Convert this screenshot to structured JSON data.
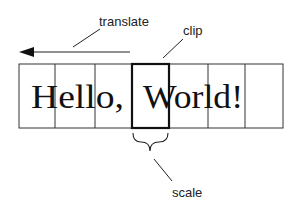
{
  "diagram": {
    "labels": {
      "translate": "translate",
      "clip": "clip",
      "scale": "scale"
    },
    "text": {
      "hello": "Hello,",
      "world": "World!"
    },
    "cells": [
      {
        "x": 19,
        "w": 36
      },
      {
        "x": 55,
        "w": 40
      },
      {
        "x": 95,
        "w": 37
      },
      {
        "x": 132,
        "w": 37,
        "highlighted": true
      },
      {
        "x": 169,
        "w": 39
      },
      {
        "x": 208,
        "w": 37
      },
      {
        "x": 245,
        "w": 38
      }
    ],
    "colors": {
      "stroke": "#222222",
      "background": "#ffffff"
    }
  }
}
